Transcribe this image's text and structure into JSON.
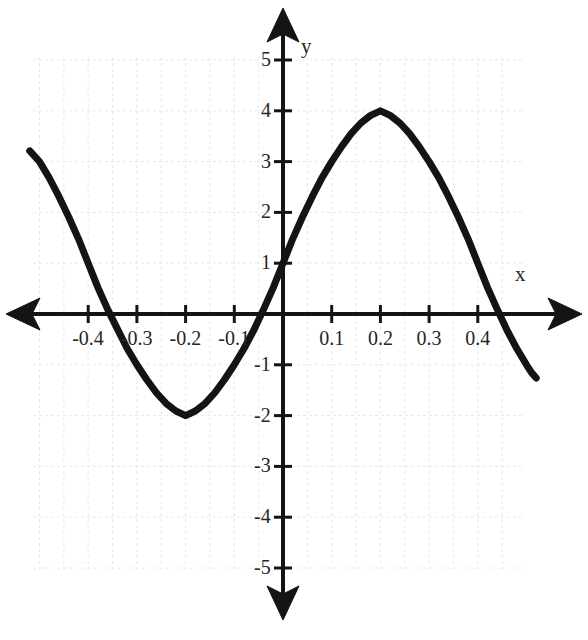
{
  "chart_data": {
    "type": "line",
    "title": "",
    "xlabel": "x",
    "ylabel": "y",
    "xlim": [
      -0.55,
      0.55
    ],
    "ylim": [
      -5.5,
      5.5
    ],
    "grid": true,
    "legend": null,
    "x_ticks": [
      -0.4,
      -0.3,
      -0.2,
      -0.1,
      0.1,
      0.2,
      0.3,
      0.4
    ],
    "x_tick_labels": [
      "-0.4",
      "-0.3",
      "-0.2",
      "-0.1",
      "0.1",
      "0.2",
      "0.3",
      "0.4"
    ],
    "y_ticks": [
      5,
      4,
      3,
      2,
      1,
      -1,
      -2,
      -3,
      -4,
      -5
    ],
    "y_tick_labels": [
      "5",
      "4",
      "3",
      "2",
      "1",
      "-1",
      "-2",
      "-3",
      "-4",
      "-5"
    ],
    "series": [
      {
        "name": "curve",
        "color": "#141414",
        "line_width": 7,
        "description": "sinusoid, amplitude 3, midline 1, period 0.4",
        "points": [
          [
            -0.52,
            3.21
          ],
          [
            -0.5,
            3.0
          ],
          [
            -0.48,
            2.68
          ],
          [
            -0.46,
            2.31
          ],
          [
            -0.44,
            1.91
          ],
          [
            -0.42,
            1.48
          ],
          [
            -0.4,
            1.0
          ],
          [
            -0.38,
            0.52
          ],
          [
            -0.36,
            0.09
          ],
          [
            -0.345,
            -0.2
          ],
          [
            -0.32,
            -0.68
          ],
          [
            -0.3,
            -1.0
          ],
          [
            -0.28,
            -1.29
          ],
          [
            -0.26,
            -1.55
          ],
          [
            -0.24,
            -1.76
          ],
          [
            -0.22,
            -1.91
          ],
          [
            -0.2,
            -2.0
          ],
          [
            -0.18,
            -1.91
          ],
          [
            -0.16,
            -1.76
          ],
          [
            -0.14,
            -1.55
          ],
          [
            -0.12,
            -1.29
          ],
          [
            -0.1,
            -1.0
          ],
          [
            -0.08,
            -0.68
          ],
          [
            -0.06,
            -0.32
          ],
          [
            -0.04,
            0.09
          ],
          [
            -0.02,
            0.52
          ],
          [
            0.0,
            1.0
          ],
          [
            0.02,
            1.48
          ],
          [
            0.04,
            1.91
          ],
          [
            0.06,
            2.31
          ],
          [
            0.08,
            2.68
          ],
          [
            0.1,
            3.0
          ],
          [
            0.12,
            3.29
          ],
          [
            0.14,
            3.55
          ],
          [
            0.16,
            3.76
          ],
          [
            0.18,
            3.91
          ],
          [
            0.2,
            4.0
          ],
          [
            0.22,
            3.91
          ],
          [
            0.24,
            3.76
          ],
          [
            0.26,
            3.55
          ],
          [
            0.28,
            3.29
          ],
          [
            0.3,
            3.0
          ],
          [
            0.32,
            2.68
          ],
          [
            0.34,
            2.31
          ],
          [
            0.36,
            1.91
          ],
          [
            0.38,
            1.48
          ],
          [
            0.4,
            1.0
          ],
          [
            0.42,
            0.52
          ],
          [
            0.44,
            0.09
          ],
          [
            0.46,
            -0.32
          ],
          [
            0.48,
            -0.68
          ],
          [
            0.5,
            -1.0
          ],
          [
            0.51,
            -1.15
          ],
          [
            0.52,
            -1.26
          ]
        ]
      }
    ]
  },
  "axes": {
    "x_axis_label": "x",
    "y_axis_label": "y",
    "x_ticks": [
      {
        "label": "-0.4",
        "value": -0.4
      },
      {
        "label": "-0.3",
        "value": -0.3
      },
      {
        "label": "-0.2",
        "value": -0.2
      },
      {
        "label": "-0.1",
        "value": -0.1
      },
      {
        "label": "0.1",
        "value": 0.1
      },
      {
        "label": "0.2",
        "value": 0.2
      },
      {
        "label": "0.3",
        "value": 0.3
      },
      {
        "label": "0.4",
        "value": 0.4
      }
    ],
    "y_ticks": [
      {
        "label": "5",
        "value": 5
      },
      {
        "label": "4",
        "value": 4
      },
      {
        "label": "3",
        "value": 3
      },
      {
        "label": "2",
        "value": 2
      },
      {
        "label": "1",
        "value": 1
      },
      {
        "label": "-1",
        "value": -1
      },
      {
        "label": "-2",
        "value": -2
      },
      {
        "label": "-3",
        "value": -3
      },
      {
        "label": "-4",
        "value": -4
      },
      {
        "label": "-5",
        "value": -5
      }
    ]
  },
  "style": {
    "axis_color": "#141414",
    "curve_color": "#141414",
    "grid_color": "#e8e8ec",
    "background": "#ffffff",
    "tick_text_color": "#262626"
  }
}
